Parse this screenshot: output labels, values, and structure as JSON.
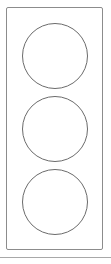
{
  "figure": {
    "background_color": "#ffffff"
  },
  "housing": {
    "name": "signal-housing",
    "shape": "rounded-rectangle",
    "stroke_color": "#8c8c8c",
    "fill_color": "#ffffff",
    "stroke_width": 1,
    "x": 6,
    "y": 7,
    "width": 97,
    "height": 243,
    "corner_radius": 2
  },
  "lamps": [
    {
      "name": "lamp-top",
      "position": "top",
      "shape": "circle",
      "stroke_color": "#6b6b6b",
      "fill_color": "#ffffff",
      "stroke_width": 1,
      "diameter": 66,
      "center_x": 54,
      "center_y": 55
    },
    {
      "name": "lamp-middle",
      "position": "middle",
      "shape": "circle",
      "stroke_color": "#6b6b6b",
      "fill_color": "#ffffff",
      "stroke_width": 1,
      "diameter": 66,
      "center_x": 54,
      "center_y": 128
    },
    {
      "name": "lamp-bottom",
      "position": "bottom",
      "shape": "circle",
      "stroke_color": "#6b6b6b",
      "fill_color": "#ffffff",
      "stroke_width": 1,
      "diameter": 66,
      "center_x": 54,
      "center_y": 201
    }
  ],
  "separator": {
    "name": "bottom-rule",
    "color": "#a8a8a8",
    "y": 257,
    "width": 111,
    "height": 1
  }
}
